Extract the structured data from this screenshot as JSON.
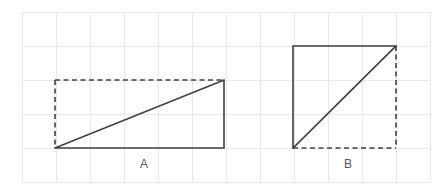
{
  "figure": {
    "title": "",
    "background_color": "#ffffff",
    "grid": {
      "visible": true,
      "color": "#e8e8e8",
      "cell_size": 34,
      "x_start": 22,
      "y_start": 12,
      "columns": 12,
      "rows": 5
    },
    "line_color": "#3f3f3f",
    "label_color": "#585858",
    "shapes": [
      {
        "id": "shape-a",
        "label": "A",
        "type": "right-triangle",
        "label_x": 144,
        "label_y": 168,
        "bounding_box": {
          "x": 55,
          "y": 80,
          "width": 169,
          "height": 68
        },
        "bounding_box_grid": {
          "x": 1,
          "y": 2,
          "width": 5,
          "height": 2
        },
        "base_units": 5,
        "height_units": 2,
        "solid_edges": [
          "bottom",
          "right",
          "hypotenuse"
        ],
        "dashed_edges": [
          "top",
          "left"
        ],
        "hypotenuse": {
          "x1": 55,
          "y1": 148,
          "x2": 224,
          "y2": 80
        },
        "right_angle_at": "bottom-right"
      },
      {
        "id": "shape-b",
        "label": "B",
        "type": "right-triangle",
        "label_x": 348,
        "label_y": 168,
        "bounding_box": {
          "x": 293,
          "y": 46,
          "width": 103,
          "height": 102
        },
        "bounding_box_grid": {
          "x": 8,
          "y": 1,
          "width": 3,
          "height": 3
        },
        "base_units": 3,
        "height_units": 3,
        "solid_edges": [
          "top",
          "left",
          "hypotenuse"
        ],
        "dashed_edges": [
          "right",
          "bottom"
        ],
        "hypotenuse": {
          "x1": 293,
          "y1": 148,
          "x2": 396,
          "y2": 46
        },
        "right_angle_at": "top-left"
      }
    ]
  }
}
